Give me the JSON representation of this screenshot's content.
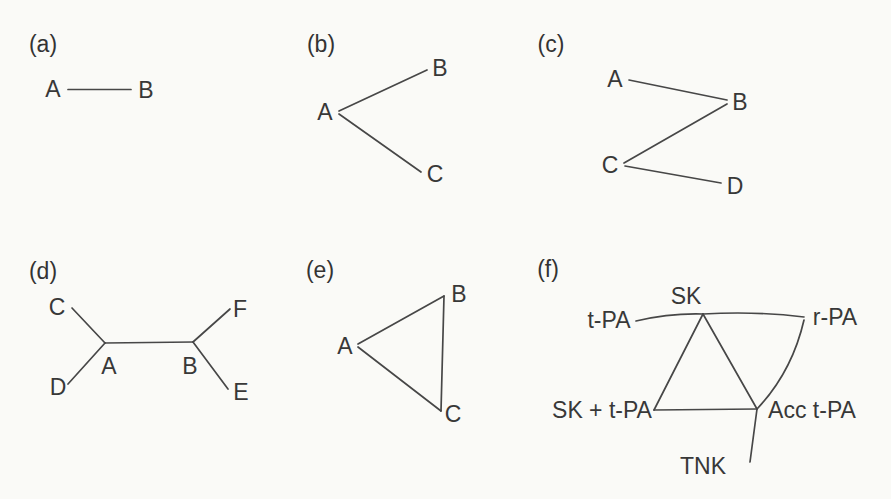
{
  "figure": {
    "background_color": "#fafaf7",
    "ink_color": "#474747"
  },
  "panels": {
    "a": {
      "tag": "(a)",
      "nodes": {
        "A": "A",
        "B": "B"
      },
      "edges": [
        "A–B"
      ]
    },
    "b": {
      "tag": "(b)",
      "nodes": {
        "A": "A",
        "B": "B",
        "C": "C"
      },
      "edges": [
        "A–B",
        "A–C"
      ]
    },
    "c": {
      "tag": "(c)",
      "nodes": {
        "A": "A",
        "B": "B",
        "C": "C",
        "D": "D"
      },
      "edges": [
        "A–B",
        "B–C",
        "C–D"
      ]
    },
    "d": {
      "tag": "(d)",
      "nodes": {
        "A": "A",
        "B": "B",
        "C": "C",
        "D": "D",
        "E": "E",
        "F": "F"
      },
      "edges": [
        "C–A",
        "D–A",
        "A–B",
        "B–F",
        "B–E"
      ]
    },
    "e": {
      "tag": "(e)",
      "nodes": {
        "A": "A",
        "B": "B",
        "C": "C"
      },
      "edges": [
        "A–B",
        "B–C",
        "C–A"
      ]
    },
    "f": {
      "tag": "(f)",
      "nodes": {
        "SK": "SK",
        "tPA": "t-PA",
        "rPA": "r-PA",
        "SK_tPA": "SK + t-PA",
        "Acc_tPA": "Acc t-PA",
        "TNK": "TNK"
      },
      "edges": [
        "t-PA–SK",
        "SK–r-PA",
        "SK–SK + t-PA",
        "SK–Acc t-PA",
        "SK + t-PA–Acc t-PA",
        "r-PA–Acc t-PA",
        "Acc t-PA–TNK"
      ]
    }
  }
}
